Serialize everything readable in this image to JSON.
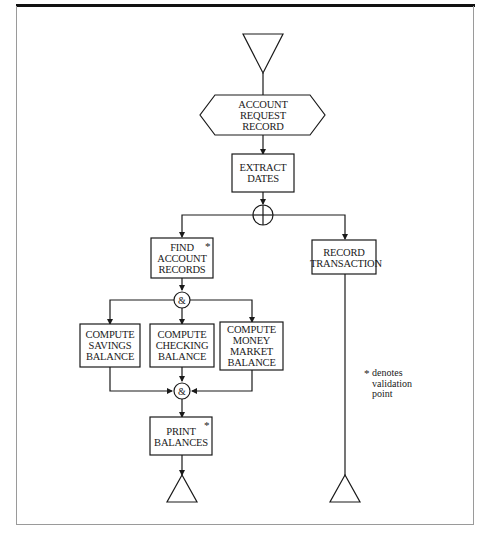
{
  "diagram": {
    "nodes": {
      "start": {
        "type": "terminator-in",
        "shape": "down-triangle"
      },
      "account_request_record": {
        "type": "data-hexagon",
        "label": "ACCOUNT\nREQUEST\nRECORD",
        "lines": [
          "ACCOUNT",
          "REQUEST",
          "RECORD"
        ]
      },
      "extract_dates": {
        "type": "process",
        "lines": [
          "EXTRACT",
          "DATES"
        ]
      },
      "split": {
        "type": "parallel-or-junction",
        "symbol": "⊕"
      },
      "find_account_records": {
        "type": "process",
        "lines": [
          "FIND",
          "ACCOUNT",
          "RECORDS"
        ],
        "validation": "*"
      },
      "record_transaction": {
        "type": "process",
        "lines": [
          "RECORD",
          "TRANSACTION"
        ]
      },
      "and_split": {
        "type": "and-junction",
        "symbol": "&"
      },
      "compute_savings": {
        "type": "process",
        "lines": [
          "COMPUTE",
          "SAVINGS",
          "BALANCE"
        ]
      },
      "compute_checking": {
        "type": "process",
        "lines": [
          "COMPUTE",
          "CHECKING",
          "BALANCE"
        ]
      },
      "compute_money_market": {
        "type": "process",
        "lines": [
          "COMPUTE",
          "MONEY",
          "MARKET",
          "BALANCE"
        ]
      },
      "and_join": {
        "type": "and-junction",
        "symbol": "&"
      },
      "print_balances": {
        "type": "process",
        "lines": [
          "PRINT",
          "BALANCES"
        ],
        "validation": "*"
      },
      "end_left": {
        "type": "terminator-out",
        "shape": "up-triangle"
      },
      "end_right": {
        "type": "terminator-out",
        "shape": "up-triangle"
      }
    },
    "legend": {
      "star": "*",
      "lines": [
        "denotes",
        "validation",
        "point"
      ]
    },
    "edges": [
      [
        "start",
        "account_request_record"
      ],
      [
        "account_request_record",
        "extract_dates"
      ],
      [
        "extract_dates",
        "split"
      ],
      [
        "split",
        "find_account_records"
      ],
      [
        "split",
        "record_transaction"
      ],
      [
        "find_account_records",
        "and_split"
      ],
      [
        "and_split",
        "compute_savings"
      ],
      [
        "and_split",
        "compute_checking"
      ],
      [
        "and_split",
        "compute_money_market"
      ],
      [
        "compute_savings",
        "and_join"
      ],
      [
        "compute_checking",
        "and_join"
      ],
      [
        "compute_money_market",
        "and_join"
      ],
      [
        "and_join",
        "print_balances"
      ],
      [
        "print_balances",
        "end_left"
      ],
      [
        "record_transaction",
        "end_right"
      ]
    ],
    "colors": {
      "line": "#1a1a1a",
      "background": "#ffffff",
      "frame": "#9a9a9a"
    }
  }
}
